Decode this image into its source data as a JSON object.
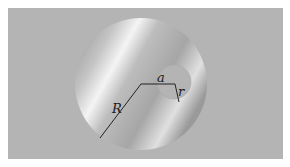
{
  "diagram": {
    "title": "",
    "background_color": "#b4b4b4",
    "outer_disk": {
      "label": "R",
      "description": "large disk of radius R",
      "center": [
        141,
        84
      ],
      "radius": 66
    },
    "hole": {
      "label": "r",
      "description": "circular hole of radius r",
      "center": [
        174,
        82
      ],
      "radius": 17
    },
    "offset": {
      "label": "a",
      "description": "distance between centers"
    },
    "labels": {
      "R": "R",
      "a": "a",
      "r": "r"
    }
  }
}
